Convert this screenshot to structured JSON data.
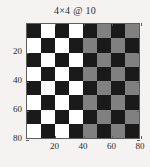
{
  "chart_data": {
    "type": "heatmap",
    "title": "4×4 @ 10",
    "xlabel": "",
    "ylabel": "",
    "xlim": [
      0,
      80
    ],
    "ylim": [
      80,
      0
    ],
    "grid": false,
    "legend": false,
    "rows": 8,
    "cols": 8,
    "cell_size": 10,
    "x_ticks": [
      20,
      40,
      60,
      80
    ],
    "y_ticks": [
      20,
      40,
      60,
      80
    ],
    "x_tick_labels": [
      "20",
      "40",
      "60",
      "80"
    ],
    "y_tick_labels": [
      "20",
      "40",
      "60",
      "80"
    ],
    "colors": {
      "black": "#1a1a1a",
      "white": "#ffffff",
      "gray": "#808080",
      "axis": "#5d5d5d",
      "background": "#f4f3f1",
      "text": "#2b2b2b"
    },
    "values": [
      [
        "black",
        "white",
        "black",
        "white",
        "black",
        "gray",
        "black",
        "gray"
      ],
      [
        "white",
        "black",
        "white",
        "black",
        "gray",
        "black",
        "gray",
        "black"
      ],
      [
        "black",
        "white",
        "black",
        "white",
        "black",
        "gray",
        "black",
        "gray"
      ],
      [
        "white",
        "black",
        "white",
        "black",
        "gray",
        "black",
        "gray",
        "black"
      ],
      [
        "black",
        "white",
        "black",
        "white",
        "black",
        "gray",
        "black",
        "gray"
      ],
      [
        "white",
        "black",
        "white",
        "black",
        "gray",
        "black",
        "gray",
        "black"
      ],
      [
        "black",
        "white",
        "black",
        "white",
        "black",
        "gray",
        "black",
        "gray"
      ],
      [
        "white",
        "black",
        "white",
        "black",
        "gray",
        "black",
        "gray",
        "black"
      ]
    ]
  }
}
